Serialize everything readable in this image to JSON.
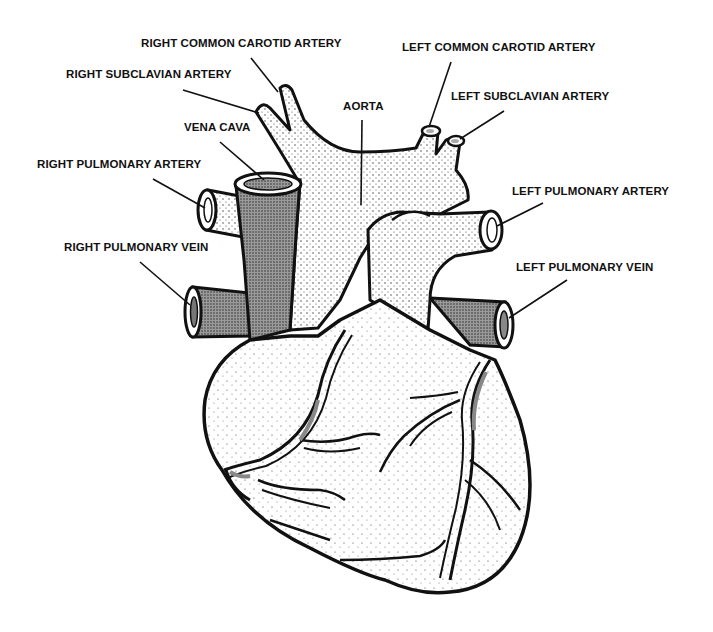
{
  "diagram": {
    "colors": {
      "ink": "#111111",
      "background": "#ffffff",
      "stipple_fill": "#e9e9e9",
      "vein_fill": "#8a8a8a"
    },
    "labels": [
      {
        "id": "right-common-carotid-artery",
        "text": "RIGHT COMMON CAROTID ARTERY",
        "x": 141,
        "y": 43,
        "leader": [
          [
            251,
            58
          ],
          [
            278,
            92
          ]
        ]
      },
      {
        "id": "right-subclavian-artery",
        "text": "RIGHT SUBCLAVIAN ARTERY",
        "x": 66,
        "y": 74,
        "leader": [
          [
            183,
            90
          ],
          [
            259,
            113
          ]
        ]
      },
      {
        "id": "vena-cava",
        "text": "VENA CAVA",
        "x": 184,
        "y": 127,
        "leader": [
          [
            220,
            142
          ],
          [
            264,
            180
          ]
        ]
      },
      {
        "id": "right-pulmonary-artery",
        "text": "RIGHT PULMONARY ARTERY",
        "x": 37,
        "y": 164,
        "leader": [
          [
            153,
            179
          ],
          [
            205,
            208
          ]
        ]
      },
      {
        "id": "right-pulmonary-vein",
        "text": "RIGHT PULMONARY VEIN",
        "x": 64,
        "y": 247,
        "leader": [
          [
            140,
            262
          ],
          [
            190,
            305
          ]
        ]
      },
      {
        "id": "aorta",
        "text": "AORTA",
        "x": 343,
        "y": 106,
        "leader": [
          [
            362,
            120
          ],
          [
            361,
            205
          ]
        ]
      },
      {
        "id": "left-common-carotid-artery",
        "text": "LEFT COMMON CAROTID ARTERY",
        "x": 402,
        "y": 47,
        "leader": [
          [
            451,
            62
          ],
          [
            429,
            127
          ]
        ]
      },
      {
        "id": "left-subclavian-artery",
        "text": "LEFT SUBCLAVIAN ARTERY",
        "x": 451,
        "y": 96,
        "leader": [
          [
            504,
            111
          ],
          [
            460,
            139
          ]
        ]
      },
      {
        "id": "left-pulmonary-artery",
        "text": "LEFT PULMONARY ARTERY",
        "x": 512,
        "y": 191,
        "leader": [
          [
            543,
            203
          ],
          [
            497,
            226
          ]
        ]
      },
      {
        "id": "left-pulmonary-vein",
        "text": "LEFT PULMONARY VEIN",
        "x": 516,
        "y": 267,
        "leader": [
          [
            567,
            280
          ],
          [
            509,
            318
          ]
        ]
      }
    ]
  }
}
